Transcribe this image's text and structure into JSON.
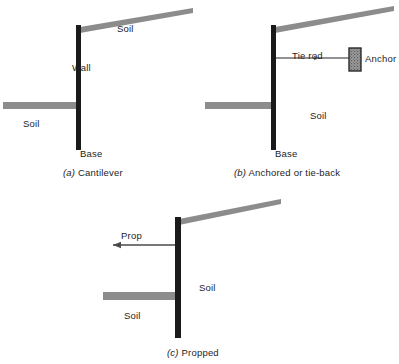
{
  "figure": {
    "background_color": "#ffffff",
    "wall_color": "#1a1a1a",
    "soil_color": "#8c8c8c",
    "line_color": "#6e6e6e",
    "text_color": "#1d1d1d"
  },
  "panels": [
    {
      "id": "panel-a",
      "caption_enum": "(a)",
      "caption_text": "Cantilever",
      "labels": {
        "soil_top": "Soil",
        "soil_left": "Soil",
        "wall": "Wall",
        "base": "Base"
      }
    },
    {
      "id": "panel-b",
      "caption_enum": "(b)",
      "caption_text": "Anchored or tie-back",
      "labels": {
        "soil_right": "Soil",
        "tie_rod": "Tie rod",
        "anchor": "Anchor",
        "base": "Base"
      }
    },
    {
      "id": "panel-c",
      "caption_enum": "(c)",
      "caption_text": "Propped",
      "labels": {
        "prop": "Prop",
        "soil_right": "Soil",
        "soil_left": "Soil"
      }
    }
  ]
}
